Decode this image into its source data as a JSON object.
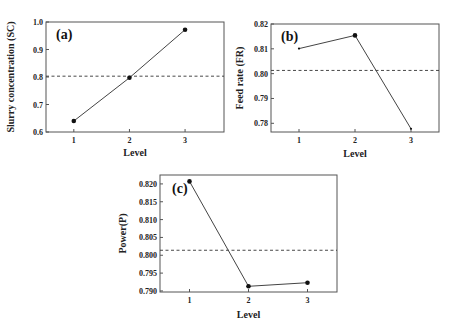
{
  "chart_data": [
    {
      "type": "line",
      "panel_label": "(a)",
      "title": "",
      "xlabel": "Level",
      "ylabel": "Slurry concentration (SC)",
      "x": [
        1,
        2,
        3
      ],
      "categories": [
        "1",
        "2",
        "3"
      ],
      "series": [
        {
          "name": "SC",
          "values": [
            0.64,
            0.797,
            0.972
          ]
        }
      ],
      "mean_line": 0.803,
      "xlim": [
        0.5,
        3.7
      ],
      "ylim": [
        0.6,
        1.0
      ],
      "yticks": [
        0.6,
        0.7,
        0.8,
        0.9,
        1.0
      ],
      "ytick_labels": [
        "0.6",
        "0.7",
        "0.8",
        "0.9",
        "1.0"
      ],
      "grid": false,
      "marker_sizes": [
        "large",
        "large",
        "large"
      ]
    },
    {
      "type": "line",
      "panel_label": "(b)",
      "title": "",
      "xlabel": "Level",
      "ylabel": "Feed rate (FR)",
      "x": [
        1,
        2,
        3
      ],
      "categories": [
        "1",
        "2",
        "3"
      ],
      "series": [
        {
          "name": "FR",
          "values": [
            0.8101,
            0.8154,
            0.7778
          ]
        }
      ],
      "mean_line": 0.8013,
      "xlim": [
        0.5,
        3.5
      ],
      "ylim": [
        0.7765,
        0.82
      ],
      "yticks": [
        0.78,
        0.79,
        0.8,
        0.81,
        0.82
      ],
      "ytick_labels": [
        "0.78",
        "0.79",
        "0.80",
        "0.81",
        "0.82"
      ],
      "grid": false,
      "marker_sizes": [
        "small",
        "large",
        "small"
      ]
    },
    {
      "type": "line",
      "panel_label": "(c)",
      "title": "",
      "xlabel": "Level",
      "ylabel": "Power(P)",
      "x": [
        1,
        2,
        3
      ],
      "categories": [
        "1",
        "2",
        "3"
      ],
      "series": [
        {
          "name": "P",
          "values": [
            0.8207,
            0.7913,
            0.7923
          ]
        }
      ],
      "mean_line": 0.8014,
      "xlim": [
        0.5,
        3.5
      ],
      "ylim": [
        0.7897,
        0.8225
      ],
      "yticks": [
        0.79,
        0.795,
        0.8,
        0.805,
        0.81,
        0.815,
        0.82
      ],
      "ytick_labels": [
        "0.790",
        "0.795",
        "0.800",
        "0.805",
        "0.810",
        "0.815",
        "0.820"
      ],
      "grid": false,
      "marker_sizes": [
        "large",
        "large",
        "large"
      ]
    }
  ]
}
